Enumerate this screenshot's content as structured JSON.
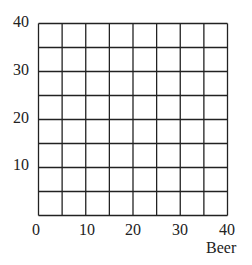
{
  "chart_data": {
    "type": "scatter",
    "title": "",
    "xlabel": "Beer",
    "ylabel": "",
    "xlim": [
      0,
      40
    ],
    "ylim": [
      0,
      40
    ],
    "grid": true,
    "grid_step": 5,
    "x_ticks": [
      "0",
      "10",
      "20",
      "30",
      "40"
    ],
    "y_ticks": [
      "10",
      "20",
      "30",
      "40"
    ],
    "series": [],
    "legend": null
  },
  "colors": {
    "grid": "#222222",
    "text": "#222222",
    "background": "#ffffff"
  }
}
